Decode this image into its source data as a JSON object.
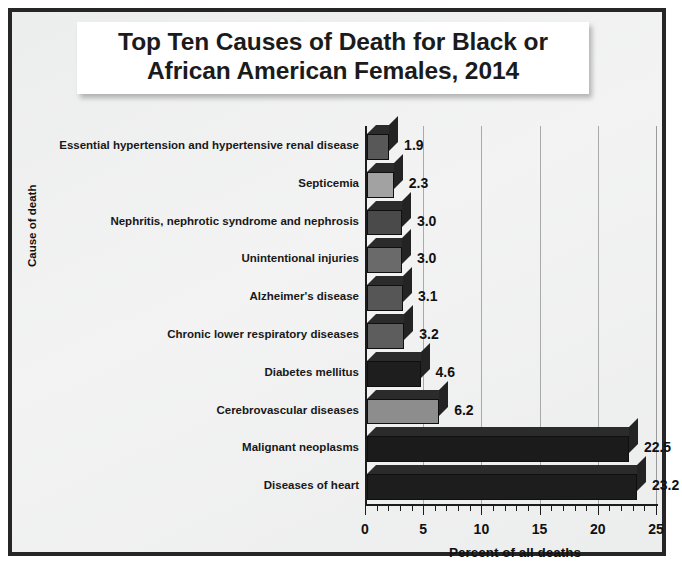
{
  "chart_data": {
    "type": "bar",
    "orientation": "horizontal",
    "title": "Top Ten Causes of Death for Black or\nAfrican American Females, 2014",
    "xlabel": "Percent of all deaths",
    "ylabel": "Cause of death",
    "xlim": [
      0,
      25
    ],
    "xticks": [
      "0",
      "5",
      "10",
      "15",
      "20",
      "25"
    ],
    "grid": "vertical",
    "legend": "none",
    "categories": [
      "Essential hypertension and hypertensive renal disease",
      "Septicemia",
      "Nephritis, nephrotic syndrome and nephrosis",
      "Unintentional injuries",
      "Alzheimer's disease",
      "Chronic lower respiratory diseases",
      "Diabetes mellitus",
      "Cerebrovascular diseases",
      "Malignant neoplasms",
      "Diseases of heart"
    ],
    "values": [
      1.9,
      2.3,
      3.0,
      3.0,
      3.1,
      3.2,
      4.6,
      6.2,
      22.5,
      23.2
    ],
    "data_labels": [
      "1.9",
      "2.3",
      "3.0",
      "3.0",
      "3.1",
      "3.2",
      "4.6",
      "6.2",
      "22.5",
      "23.2"
    ],
    "bar_colors": [
      "#585858",
      "#a2a2a2",
      "#4a4a4a",
      "#6a6a6a",
      "#565656",
      "#5d5d5d",
      "#1e1e1e",
      "#8d8d8d",
      "#1b1b1b",
      "#1d1d1d"
    ]
  },
  "colors": {
    "frame_border": "#262626",
    "background": "#eceded",
    "title_box": "#ffffff",
    "gridline": "#a9a9a9",
    "axis": "#1c1c1c",
    "text": "#111111"
  }
}
